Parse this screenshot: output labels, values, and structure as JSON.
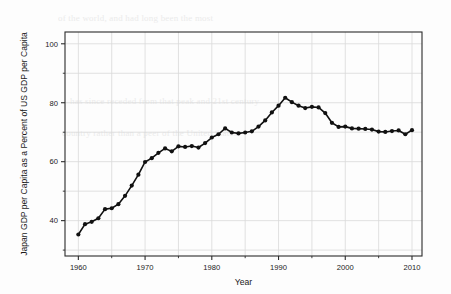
{
  "chart_data": {
    "type": "line",
    "title": "",
    "subtitle": "",
    "xlabel": "Year",
    "ylabel": "Japan GDP per Capita as a Percent of US GDP per Capita",
    "xlim": [
      1958,
      2011.5
    ],
    "ylim": [
      28,
      104
    ],
    "xticks": [
      1960,
      1970,
      1980,
      1990,
      2000,
      2010
    ],
    "xtick_labels": [
      "1960",
      "1970",
      "1980",
      "1990",
      "2000",
      "2010"
    ],
    "yticks": [
      40,
      60,
      80,
      100
    ],
    "ytick_labels": [
      "40",
      "60",
      "80",
      "100"
    ],
    "x_minor_ticks": [
      1965,
      1975,
      1985,
      1995,
      2005
    ],
    "y_minor_ticks": [
      30,
      50,
      70,
      90
    ],
    "grid": true,
    "grid_color": "#d9d9d9",
    "legend": null,
    "legend_position": "none",
    "marker": "circle-filled",
    "line_color": "#111111",
    "marker_color": "#111111",
    "x": [
      1960,
      1961,
      1962,
      1963,
      1964,
      1965,
      1966,
      1967,
      1968,
      1969,
      1970,
      1971,
      1972,
      1973,
      1974,
      1975,
      1976,
      1977,
      1978,
      1979,
      1980,
      1981,
      1982,
      1983,
      1984,
      1985,
      1986,
      1987,
      1988,
      1989,
      1990,
      1991,
      1992,
      1993,
      1994,
      1995,
      1996,
      1997,
      1998,
      1999,
      2000,
      2001,
      2002,
      2003,
      2004,
      2005,
      2006,
      2007,
      2008,
      2009,
      2010
    ],
    "y": [
      35.3,
      38.8,
      39.6,
      40.8,
      43.9,
      44.2,
      45.6,
      48.4,
      51.9,
      55.6,
      59.9,
      61.2,
      63.0,
      64.5,
      63.5,
      65.2,
      65.0,
      65.3,
      64.8,
      66.3,
      68.2,
      69.3,
      71.3,
      69.9,
      69.6,
      69.9,
      70.3,
      71.9,
      74.0,
      76.7,
      79.0,
      81.7,
      80.2,
      79.0,
      78.2,
      78.6,
      78.4,
      76.5,
      73.2,
      71.8,
      71.9,
      71.3,
      71.2,
      71.1,
      70.9,
      70.2,
      70.1,
      70.4,
      70.6,
      69.3,
      70.7
    ],
    "annotations": [],
    "source_note": ""
  },
  "bleed_text": {
    "line1": "of the world, and had long been the most",
    "line2": "has since receded from that peak and 21st century",
    "line3": "country rather than a peer of the United States"
  }
}
